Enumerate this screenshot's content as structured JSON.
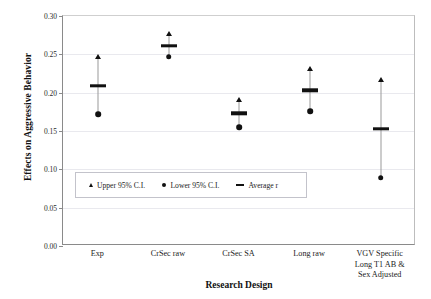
{
  "chart_data": {
    "type": "scatter",
    "title": "",
    "xlabel": "Research Design",
    "ylabel": "Effects on Aggressive Behavior",
    "ylim": [
      0.0,
      0.3
    ],
    "yticks": [
      "0.00",
      "0.05",
      "0.10",
      "0.15",
      "0.20",
      "0.25",
      "0.30"
    ],
    "ytick_values": [
      0.0,
      0.05,
      0.1,
      0.15,
      0.2,
      0.25,
      0.3
    ],
    "grid": true,
    "legend_position": "inside-lower-left",
    "categories": [
      "Exp",
      "CrSec raw",
      "CrSec SA",
      "Long raw",
      "VGV Specific Long T1 AB & Sex Adjusted"
    ],
    "category_label_lines": [
      [
        "Exp"
      ],
      [
        "CrSec raw"
      ],
      [
        "CrSec SA"
      ],
      [
        "Long raw"
      ],
      [
        "VGV Specific",
        "Long T1 AB &",
        "Sex Adjusted"
      ]
    ],
    "series": [
      {
        "name": "Upper 95% C.I.",
        "marker": "triangle",
        "values": [
          0.247,
          0.277,
          0.19,
          0.231,
          0.216
        ]
      },
      {
        "name": "Average r",
        "marker": "dash",
        "values": [
          0.209,
          0.261,
          0.173,
          0.203,
          0.153
        ]
      },
      {
        "name": "Lower 95% C.I.",
        "marker": "circle",
        "values": [
          0.172,
          0.247,
          0.155,
          0.176,
          0.089
        ]
      }
    ],
    "legend": [
      {
        "label": "Upper 95% C.I.",
        "marker": "triangle"
      },
      {
        "label": "Lower 95% C.I.",
        "marker": "circle"
      },
      {
        "label": "Average r",
        "marker": "dash"
      }
    ],
    "colors": {
      "marker": "#111111",
      "whisker": "#9a9a9a",
      "grid": "#e9e9ee",
      "axis": "#8a8a8a",
      "background": "#ffffff"
    }
  }
}
